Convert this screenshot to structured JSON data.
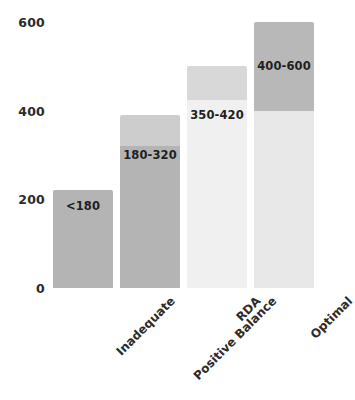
{
  "chart_data": {
    "type": "bar",
    "title": "",
    "xlabel": "",
    "ylabel": "",
    "ylim": [
      0,
      600
    ],
    "yticks": [
      0,
      200,
      400,
      600
    ],
    "grid": false,
    "legend": null,
    "categories": [
      "Inadequate",
      "Positive Balance",
      "RDA",
      "Optimal"
    ],
    "values": [
      220,
      390,
      500,
      600
    ],
    "data_labels": [
      "<180",
      "180-320",
      "350-420",
      "400-600"
    ],
    "bars": [
      {
        "category": "Inadequate",
        "top": 220,
        "label": "<180",
        "label_value": 185,
        "segments": [
          {
            "from": 0,
            "to": 220,
            "color": "#b4b4b4"
          }
        ]
      },
      {
        "category": "Positive Balance",
        "top": 390,
        "label": "180-320",
        "label_value": 300,
        "segments": [
          {
            "from": 320,
            "to": 390,
            "color": "#cdcdcd"
          },
          {
            "from": 0,
            "to": 320,
            "color": "#b4b4b4"
          }
        ]
      },
      {
        "category": "RDA",
        "top": 500,
        "label": "350-420",
        "label_value": 390,
        "segments": [
          {
            "from": 425,
            "to": 500,
            "color": "#d8d8d8"
          },
          {
            "from": 0,
            "to": 425,
            "color": "#f0f0f0"
          }
        ]
      },
      {
        "category": "Optimal",
        "top": 600,
        "label": "400-600",
        "label_value": 500,
        "segments": [
          {
            "from": 400,
            "to": 600,
            "color": "#b8b8b8"
          },
          {
            "from": 0,
            "to": 400,
            "color": "#e8e8e8"
          }
        ]
      }
    ]
  },
  "axis": {
    "y_tick_labels": [
      "600",
      "400",
      "200",
      "0"
    ]
  }
}
